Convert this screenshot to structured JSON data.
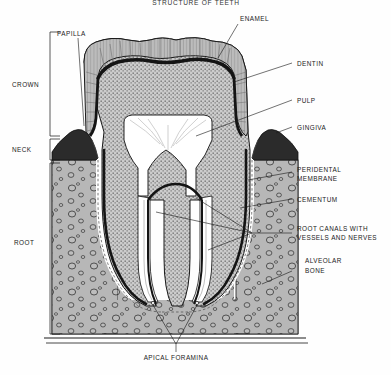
{
  "title": "STRUCTURE OF TEETH",
  "canvas": {
    "width": 391,
    "height": 375,
    "background": "#fefefe"
  },
  "labels": {
    "papilla": "PAPILLA",
    "enamel": "ENAMEL",
    "dentin": "DENTIN",
    "pulp": "PULP",
    "gingiva": "GINGIVA",
    "peridental_line1": "PERIDENTAL",
    "peridental_line2": "MEMBRANE",
    "cementum": "CEMENTUM",
    "root_canals_line1": "ROOT CANALS WITH",
    "root_canals_line2": "VESSELS AND NERVES",
    "alveolar_line1": "ALVEOLAR",
    "alveolar_line2": "BONE",
    "crown": "CROWN",
    "neck": "NECK",
    "root": "ROOT",
    "apical_foramina": "APICAL FORAMINA"
  },
  "regions": {
    "crown_bracket": "CROWN",
    "neck_bracket": "NECK",
    "root_bracket": "ROOT"
  },
  "colors": {
    "ink": "#1a1a1a",
    "enamel_fill": "#b9b9b9",
    "dentin_fill": "#c9c9c9",
    "pulp_fill": "#ffffff",
    "gingiva_fill": "#2e2e2e",
    "bone_fill": "#b5b5b5",
    "cementum_fill": "#222222",
    "background": "#fefefe"
  }
}
